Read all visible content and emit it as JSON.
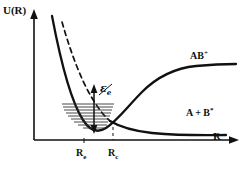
{
  "figure": {
    "type": "potential-energy-curve-diagram",
    "axes": {
      "y_label": "U(R)",
      "x_label": "R",
      "y_axis_arrow": true,
      "x_axis_arrow": true
    },
    "labels": {
      "upper_curve": {
        "base": "AB",
        "superscript": "+"
      },
      "lower_curve": {
        "base": "A + B",
        "superscript": "*"
      },
      "energy_gap": {
        "base": "ε",
        "subscript": "e"
      }
    },
    "ticks": [
      {
        "base": "R",
        "subscript": "e",
        "name": "equilibrium-internuclear-distance"
      },
      {
        "base": "R",
        "subscript": "c",
        "name": "crossing-internuclear-distance"
      }
    ],
    "colors": {
      "ink": "#111111",
      "background": "#ffffff",
      "levels": "#333333"
    },
    "elements": {
      "vibrational_levels_count": 9,
      "dashed_repulsive_branch": true,
      "dashed_crossing_dropline": true,
      "double_headed_energy_arrow": true
    }
  }
}
